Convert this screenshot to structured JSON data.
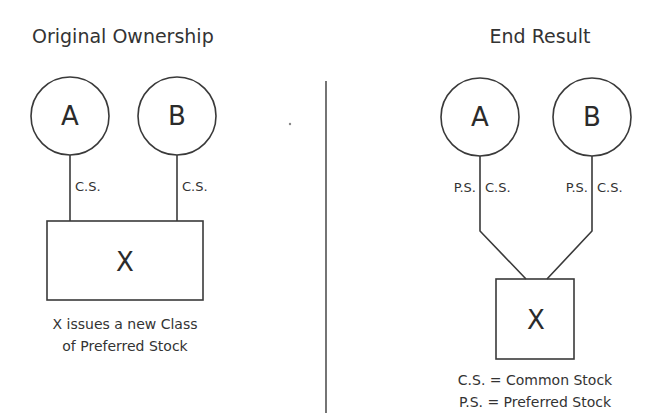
{
  "left_panel": {
    "title": "Original Ownership",
    "shareholders": [
      {
        "label": "A",
        "stock_label": "C.S."
      },
      {
        "label": "B",
        "stock_label": "C.S."
      }
    ],
    "company": {
      "label": "X"
    },
    "caption_line1": "X issues a new Class",
    "caption_line2": "of Preferred Stock"
  },
  "right_panel": {
    "title": "End Result",
    "shareholders": [
      {
        "label": "A",
        "left_label": "P.S.",
        "right_label": "C.S."
      },
      {
        "label": "B",
        "left_label": "P.S.",
        "right_label": "C.S."
      }
    ],
    "company": {
      "label": "X"
    },
    "legend_line1": "C.S. = Common Stock",
    "legend_line2": "P.S. = Preferred Stock"
  },
  "colors": {
    "line": "#3a3a3a",
    "text": "#333333",
    "background": "#ffffff"
  }
}
